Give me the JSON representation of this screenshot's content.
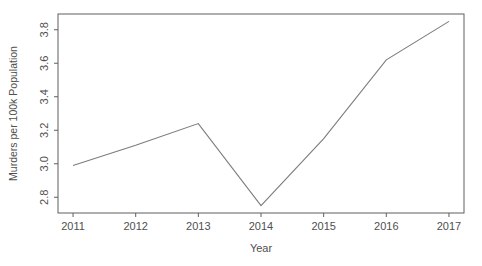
{
  "figure": {
    "width": 482,
    "height": 266,
    "background": "#ffffff"
  },
  "chart_data": {
    "type": "line",
    "x": [
      2011,
      2012,
      2013,
      2014,
      2015,
      2016,
      2017
    ],
    "values": [
      2.99,
      3.11,
      3.24,
      2.75,
      3.15,
      3.62,
      3.85
    ],
    "title": "",
    "xlabel": "Year",
    "ylabel": "Murders per 100k Population",
    "xtick_labels": [
      "2011",
      "2012",
      "2013",
      "2014",
      "2015",
      "2016",
      "2017"
    ],
    "xticks": [
      2011,
      2012,
      2013,
      2014,
      2015,
      2016,
      2017
    ],
    "ytick_labels": [
      "2.8",
      "3.0",
      "3.2",
      "3.4",
      "3.6",
      "3.8"
    ],
    "yticks": [
      2.8,
      3.0,
      3.2,
      3.4,
      3.6,
      3.8
    ],
    "xlim": [
      2010.76,
      2017.24
    ],
    "ylim": [
      2.706,
      3.894
    ],
    "grid": false,
    "legend": null,
    "ytick_label_rotation": -90,
    "colors": {
      "line": "#7c7c7c",
      "axis": "#5f5f5f",
      "tick_text": "#4f4f4f",
      "label_text": "#4f4f4f"
    }
  }
}
